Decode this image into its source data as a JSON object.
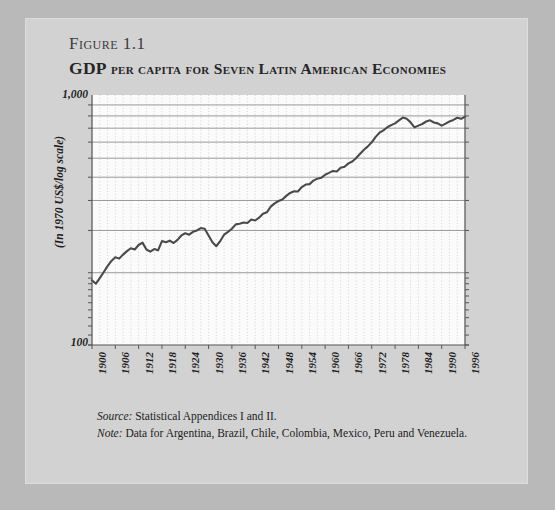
{
  "figure": {
    "label": "Figure 1.1",
    "title_lead": "GDP",
    "title_rest": "per capita for Seven Latin American Economies",
    "source_label": "Source:",
    "source_text": "Statistical Appendices I and II.",
    "note_label": "Note:",
    "note_text": "Data for Argentina, Brazil, Chile, Colombia, Mexico, Peru and Venezuela."
  },
  "colors": {
    "page_background": "#b9b9b9",
    "card_background": "#d2d2d2",
    "plot_background": "#fbfbfb",
    "line": "#4a4a4a",
    "gridline_major": "#8e8e8e",
    "gridline_minor": "#c9c9c9",
    "axis": "#555555",
    "text": "#1e1e1e"
  },
  "chart_data": {
    "type": "line",
    "title": "GDP per capita for Seven Latin American Economies",
    "subtitle": "Figure 1.1",
    "xlabel": "",
    "ylabel": "(In 1970 US$/log scale)",
    "yscale": "log",
    "ylim": [
      100,
      1100
    ],
    "xlim": [
      1900,
      1996
    ],
    "grid": true,
    "legend": false,
    "ytick_labels": [
      "1,000",
      "100"
    ],
    "ytick_values": [
      1000,
      100
    ],
    "xtick_labels": [
      "1900",
      "1906",
      "1912",
      "1918",
      "1924",
      "1930",
      "1936",
      "1942",
      "1948",
      "1954",
      "1960",
      "1966",
      "1972",
      "1978",
      "1984",
      "1990",
      "1996"
    ],
    "xtick_values": [
      1900,
      1906,
      1912,
      1918,
      1924,
      1930,
      1936,
      1942,
      1948,
      1954,
      1960,
      1966,
      1972,
      1978,
      1984,
      1990,
      1996
    ],
    "series": [
      {
        "name": "GDP per capita, seven Latin American economies",
        "x": [
          1900,
          1901,
          1902,
          1903,
          1904,
          1905,
          1906,
          1907,
          1908,
          1909,
          1910,
          1911,
          1912,
          1913,
          1914,
          1915,
          1916,
          1917,
          1918,
          1919,
          1920,
          1921,
          1922,
          1923,
          1924,
          1925,
          1926,
          1927,
          1928,
          1929,
          1930,
          1931,
          1932,
          1933,
          1934,
          1935,
          1936,
          1937,
          1938,
          1939,
          1940,
          1941,
          1942,
          1943,
          1944,
          1945,
          1946,
          1947,
          1948,
          1949,
          1950,
          1951,
          1952,
          1953,
          1954,
          1955,
          1956,
          1957,
          1958,
          1959,
          1960,
          1961,
          1962,
          1963,
          1964,
          1965,
          1966,
          1967,
          1968,
          1969,
          1970,
          1971,
          1972,
          1973,
          1974,
          1975,
          1976,
          1977,
          1978,
          1979,
          1980,
          1981,
          1982,
          1983,
          1984,
          1985,
          1986,
          1987,
          1988,
          1989,
          1990,
          1991,
          1992,
          1993,
          1994,
          1995,
          1996
        ],
        "y": [
          186,
          180,
          190,
          201,
          213,
          224,
          232,
          229,
          238,
          246,
          253,
          250,
          261,
          267,
          250,
          245,
          251,
          248,
          271,
          268,
          272,
          266,
          274,
          286,
          292,
          288,
          296,
          300,
          307,
          305,
          286,
          268,
          258,
          271,
          288,
          296,
          305,
          318,
          320,
          324,
          322,
          333,
          330,
          339,
          352,
          357,
          377,
          389,
          398,
          404,
          418,
          430,
          437,
          436,
          455,
          466,
          468,
          484,
          493,
          497,
          512,
          521,
          531,
          528,
          548,
          553,
          571,
          581,
          601,
          626,
          651,
          672,
          699,
          736,
          766,
          784,
          807,
          824,
          838,
          862,
          886,
          876,
          846,
          806,
          820,
          833,
          853,
          863,
          845,
          838,
          820,
          836,
          853,
          866,
          884,
          875,
          893
        ]
      }
    ]
  }
}
